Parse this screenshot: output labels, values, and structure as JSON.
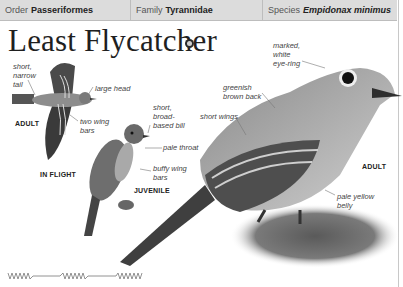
{
  "header": {
    "order_label": "Order",
    "order_value": "Passeriformes",
    "family_label": "Family",
    "family_value": "Tyrannidae",
    "species_label": "Species",
    "species_value": "Empidonax minimus"
  },
  "title": "Least Flycatcher",
  "sound_icon": "speaker-icon",
  "flight_illustration": {
    "labels": {
      "tail": [
        "short,",
        "narrow",
        "tail"
      ],
      "head": "large head",
      "wingbars": [
        "two wing",
        "bars"
      ]
    },
    "caption_adult": "ADULT",
    "caption": "IN FLIGHT"
  },
  "juvenile_illustration": {
    "labels": {
      "bill": [
        "short,",
        "broad-",
        "based bill"
      ],
      "throat": "pale throat",
      "wingbars": [
        "buffy wing",
        "bars"
      ]
    },
    "caption": "JUVENILE"
  },
  "adult_illustration": {
    "labels": {
      "eyering": [
        "marked,",
        "white",
        "eye-ring"
      ],
      "back": [
        "greenish",
        "brown back"
      ],
      "wings": "short wings",
      "belly": [
        "pale yellow",
        "belly"
      ]
    },
    "caption": "ADULT"
  },
  "song_graph": "song-waveform-icon"
}
